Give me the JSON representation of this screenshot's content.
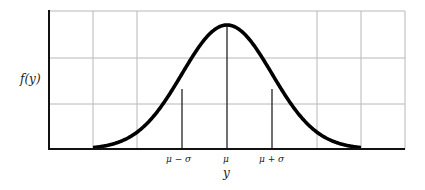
{
  "chart_data": {
    "type": "line",
    "title": "",
    "xlabel": "y",
    "ylabel": "f(y)",
    "x_ticks": [
      {
        "label": "μ − σ",
        "value": -1
      },
      {
        "label": "μ",
        "value": 0
      },
      {
        "label": "μ + σ",
        "value": 1
      }
    ],
    "x_range_sigma": [
      -3,
      3
    ],
    "grid": true,
    "grid_columns": 8,
    "grid_rows": 3,
    "series": [
      {
        "name": "f(y)",
        "x": [
          -3,
          -2.5,
          -2,
          -1.5,
          -1,
          -0.5,
          0,
          0.5,
          1,
          1.5,
          2,
          2.5,
          3
        ],
        "values": [
          0.004,
          0.018,
          0.054,
          0.13,
          0.242,
          0.352,
          0.399,
          0.352,
          0.242,
          0.13,
          0.054,
          0.018,
          0.004
        ]
      }
    ],
    "vertical_markers": [
      "μ − σ",
      "μ",
      "μ + σ"
    ]
  },
  "labels": {
    "ylabel": "f(y)",
    "xlabel": "y",
    "tick_minus": "μ − σ",
    "tick_mu": "μ",
    "tick_plus": "μ + σ"
  }
}
